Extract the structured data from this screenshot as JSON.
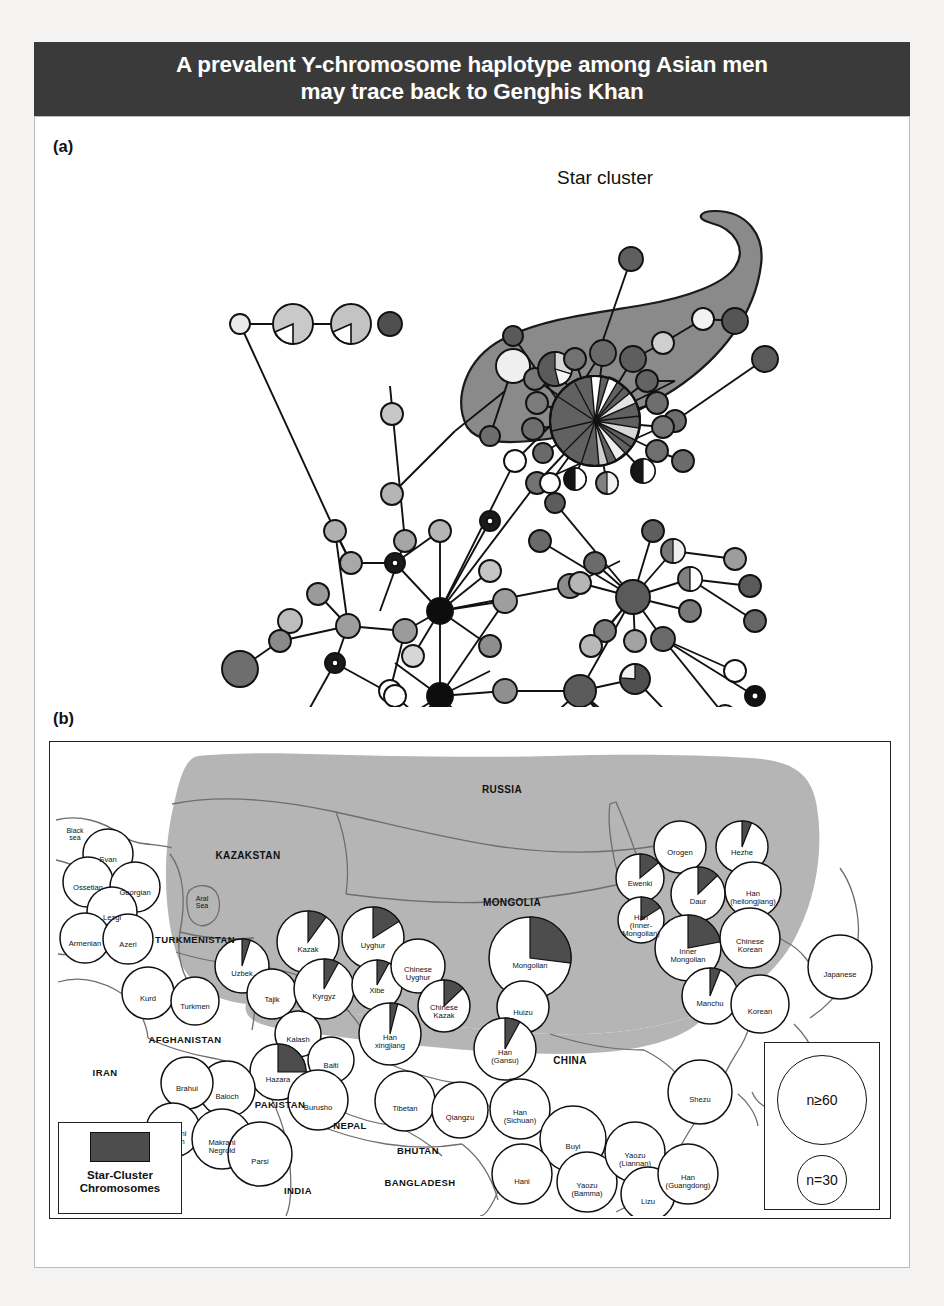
{
  "title": {
    "line1": "A prevalent Y-chromosome haplotype among Asian men",
    "line2": "may trace back to Genghis Khan",
    "background": "#3a3a3a",
    "color": "#ffffff"
  },
  "panels": {
    "a_label": "(a)",
    "b_label": "(b)"
  },
  "network": {
    "star_cluster_label": "Star cluster",
    "description": "Median-joining network of Y-chromosome haplotypes; node area proportional to frequency, shading denotes population group.",
    "blob_fill": "#8a8a8a",
    "hub_color": "#0d0d0d"
  },
  "map": {
    "shaded_region_fill": "#b0b0b0",
    "shaded_region_meaning": "Approximate extent of the Mongol empire",
    "land_outline": "#6a6a6a",
    "countries": [
      {
        "name": "RUSSIA",
        "x": 452,
        "y": 47,
        "size": 10
      },
      {
        "name": "KAZAKSTAN",
        "x": 198,
        "y": 113,
        "size": 10
      },
      {
        "name": "MONGOLIA",
        "x": 462,
        "y": 160,
        "size": 10
      },
      {
        "name": "TURKMENISTAN",
        "x": 145,
        "y": 197,
        "size": 9.5
      },
      {
        "name": "AFGHANISTAN",
        "x": 135,
        "y": 297,
        "size": 9.5
      },
      {
        "name": "IRAN",
        "x": 55,
        "y": 330,
        "size": 9.5
      },
      {
        "name": "PAKISTAN",
        "x": 230,
        "y": 362,
        "size": 9.5
      },
      {
        "name": "NEPAL",
        "x": 300,
        "y": 383,
        "size": 9.5
      },
      {
        "name": "BHUTAN",
        "x": 368,
        "y": 408,
        "size": 9.5
      },
      {
        "name": "BANGLADESH",
        "x": 370,
        "y": 440,
        "size": 9.5
      },
      {
        "name": "INDIA",
        "x": 248,
        "y": 448,
        "size": 9.5
      },
      {
        "name": "CHINA",
        "x": 520,
        "y": 318,
        "size": 10
      },
      {
        "name": "PACIFIC OCEAN",
        "x": 762,
        "y": 322,
        "size": 7.6
      }
    ],
    "seas": [
      {
        "name": "Black\nsea",
        "x": 25,
        "y": 92
      },
      {
        "name": "Aral\nSea",
        "x": 152,
        "y": 160
      }
    ],
    "populations": [
      {
        "name": "Svan",
        "x": 58,
        "y": 112,
        "r": 25,
        "star": 0
      },
      {
        "name": "Ossetian",
        "x": 38,
        "y": 140,
        "r": 25,
        "star": 0
      },
      {
        "name": "Georgian",
        "x": 85,
        "y": 145,
        "r": 25,
        "star": 0
      },
      {
        "name": "Lezgi",
        "x": 62,
        "y": 170,
        "r": 25,
        "star": 0
      },
      {
        "name": "Armenian",
        "x": 35,
        "y": 196,
        "r": 25,
        "star": 0
      },
      {
        "name": "Azeri",
        "x": 78,
        "y": 197,
        "r": 25,
        "star": 0
      },
      {
        "name": "Kurd",
        "x": 98,
        "y": 251,
        "r": 26,
        "star": 0
      },
      {
        "name": "Turkmen",
        "x": 145,
        "y": 259,
        "r": 24,
        "star": 0
      },
      {
        "name": "Uzbek",
        "x": 192,
        "y": 224,
        "r": 27,
        "star": 5
      },
      {
        "name": "Tajik",
        "x": 222,
        "y": 252,
        "r": 25,
        "star": 0
      },
      {
        "name": "Kazak",
        "x": 258,
        "y": 200,
        "r": 31,
        "star": 10
      },
      {
        "name": "Kyrgyz",
        "x": 274,
        "y": 247,
        "r": 30,
        "star": 8
      },
      {
        "name": "Uyghur",
        "x": 323,
        "y": 196,
        "r": 31,
        "star": 16
      },
      {
        "name": "Xibe",
        "x": 327,
        "y": 243,
        "r": 25,
        "star": 8
      },
      {
        "name": "Chinese\nUyghur",
        "x": 368,
        "y": 224,
        "r": 27,
        "star": 0
      },
      {
        "name": "Chinese\nKazak",
        "x": 394,
        "y": 264,
        "r": 26,
        "star": 13
      },
      {
        "name": "Han\nxingjiang",
        "x": 340,
        "y": 292,
        "r": 31,
        "star": 4
      },
      {
        "name": "Mongolian",
        "x": 480,
        "y": 216,
        "r": 41,
        "star": 27
      },
      {
        "name": "Huizu",
        "x": 473,
        "y": 265,
        "r": 26,
        "star": 0
      },
      {
        "name": "Han\n(Gansu)",
        "x": 455,
        "y": 307,
        "r": 31,
        "star": 8
      },
      {
        "name": "Ewenki",
        "x": 590,
        "y": 136,
        "r": 24,
        "star": 14
      },
      {
        "name": "Orogen",
        "x": 630,
        "y": 105,
        "r": 26,
        "star": 0
      },
      {
        "name": "Hezhe",
        "x": 692,
        "y": 105,
        "r": 26,
        "star": 6
      },
      {
        "name": "Daur",
        "x": 648,
        "y": 152,
        "r": 27,
        "star": 13
      },
      {
        "name": "Han\n(heilongjiang)",
        "x": 703,
        "y": 148,
        "r": 28,
        "star": 0
      },
      {
        "name": "Han\n(Inner-\nMongolian)",
        "x": 591,
        "y": 178,
        "r": 23,
        "star": 16
      },
      {
        "name": "Inner\nMongolian",
        "x": 638,
        "y": 206,
        "r": 33,
        "star": 22
      },
      {
        "name": "Chinese\nKorean",
        "x": 700,
        "y": 196,
        "r": 30,
        "star": 0
      },
      {
        "name": "Manchu",
        "x": 660,
        "y": 254,
        "r": 28,
        "star": 6
      },
      {
        "name": "Korean",
        "x": 710,
        "y": 262,
        "r": 29,
        "star": 0
      },
      {
        "name": "Japanese",
        "x": 790,
        "y": 225,
        "r": 32,
        "star": 0
      },
      {
        "name": "Kalash",
        "x": 248,
        "y": 292,
        "r": 23,
        "star": 0
      },
      {
        "name": "Hazara",
        "x": 228,
        "y": 330,
        "r": 28,
        "star": 25
      },
      {
        "name": "Balti",
        "x": 281,
        "y": 318,
        "r": 23,
        "star": 0
      },
      {
        "name": "Burusho",
        "x": 268,
        "y": 358,
        "r": 30,
        "star": 0
      },
      {
        "name": "Baloch",
        "x": 177,
        "y": 347,
        "r": 28,
        "star": 0
      },
      {
        "name": "Brahui",
        "x": 137,
        "y": 341,
        "r": 26,
        "star": 0
      },
      {
        "name": "Makrani\nBaloch",
        "x": 123,
        "y": 388,
        "r": 27,
        "star": 0
      },
      {
        "name": "Makrani\nNegroid",
        "x": 172,
        "y": 397,
        "r": 30,
        "star": 0
      },
      {
        "name": "Parsi",
        "x": 210,
        "y": 412,
        "r": 32,
        "star": 0
      },
      {
        "name": "Tibetan",
        "x": 355,
        "y": 359,
        "r": 30,
        "star": 0
      },
      {
        "name": "Qiangzu",
        "x": 410,
        "y": 368,
        "r": 28,
        "star": 0
      },
      {
        "name": "Han\n(Sichuan)",
        "x": 470,
        "y": 367,
        "r": 30,
        "star": 0
      },
      {
        "name": "Buyi",
        "x": 523,
        "y": 397,
        "r": 33,
        "star": 0
      },
      {
        "name": "Hani",
        "x": 472,
        "y": 432,
        "r": 30,
        "star": 0
      },
      {
        "name": "Yaozu\n(Bamma)",
        "x": 537,
        "y": 440,
        "r": 30,
        "star": 0
      },
      {
        "name": "Yaozu\n(Liannan)",
        "x": 585,
        "y": 410,
        "r": 30,
        "star": 0
      },
      {
        "name": "Lizu",
        "x": 598,
        "y": 452,
        "r": 27,
        "star": 0
      },
      {
        "name": "Han\n(Guangdong)",
        "x": 638,
        "y": 432,
        "r": 30,
        "star": 0
      },
      {
        "name": "Shezu",
        "x": 650,
        "y": 350,
        "r": 32,
        "star": 0
      }
    ],
    "size_legend": {
      "large_label": "n≥60",
      "small_label": "n=30"
    },
    "star_legend": {
      "swatch_color": "#4d4d4d",
      "label": "Star-Cluster\nChromosomes"
    }
  }
}
